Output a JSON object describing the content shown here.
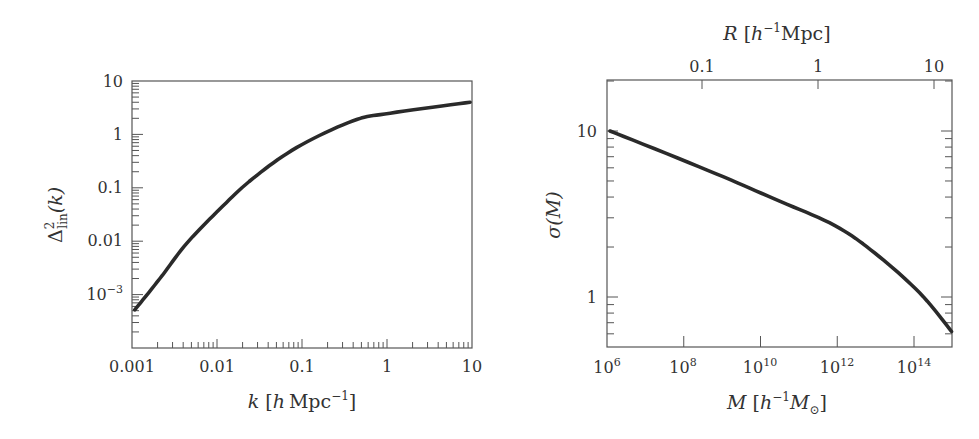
{
  "chart_data": [
    {
      "type": "line",
      "title": "",
      "xlabel": "k [h Mpc^-1]",
      "ylabel": "Δ²_lin(k)",
      "xscale": "log",
      "yscale": "log",
      "xlim": [
        0.001,
        10
      ],
      "ylim": [
        0.0001,
        10
      ],
      "grid": false,
      "x_tick_labels": [
        "0.001",
        "0.01",
        "0.1",
        "1",
        "10"
      ],
      "y_tick_labels": [
        "10",
        "1",
        "0.1",
        "0.01",
        "10^-3"
      ],
      "series": [
        {
          "name": "Δ²_lin(k)",
          "x": [
            0.00108,
            0.00213,
            0.0044,
            0.0108,
            0.0265,
            0.087,
            0.4,
            1.09,
            9.5
          ],
          "y": [
            0.00052,
            0.002,
            0.0091,
            0.04,
            0.15,
            0.57,
            1.8,
            2.5,
            4.0
          ]
        }
      ]
    },
    {
      "type": "line",
      "title": "",
      "xlabel": "M [h^-1 M_⊙]",
      "ylabel": "σ(M)",
      "x2label": "R [h^-1 Mpc]",
      "xscale": "log",
      "yscale": "log",
      "xlim": [
        1000000.0,
        1100000000000000.0
      ],
      "ylim": [
        0.5,
        20
      ],
      "grid": false,
      "x_tick_labels": [
        "10^6",
        "10^8",
        "10^10",
        "10^12",
        "10^14"
      ],
      "x2_tick_labels": [
        "0.1",
        "1",
        "10"
      ],
      "y_tick_labels": [
        "10",
        "1"
      ],
      "series": [
        {
          "name": "σ(M)",
          "x": [
            1200000.0,
            420000000.0,
            23000000000.0,
            850000000000.0,
            9500000000000.0,
            140000000000000.0,
            950000000000000.0
          ],
          "y": [
            10.0,
            5.8,
            3.9,
            2.7,
            1.84,
            1.06,
            0.62
          ]
        }
      ]
    }
  ],
  "left_chart": {
    "x_ticks": {
      "t0": "0.001",
      "t1": "0.01",
      "t2": "0.1",
      "t3": "1",
      "t4": "10"
    },
    "y_ticks": {
      "t0": "10",
      "t1": "1",
      "t2": "0.1",
      "t3": "0.01",
      "t4_base": "10",
      "t4_exp": "−3"
    },
    "xlabel": {
      "var": "k",
      "open": "[",
      "h": "h",
      "unit": "Mpc",
      "exp": "−1",
      "close": "]"
    },
    "ylabel": {
      "delta": "Δ",
      "sup": "2",
      "sub": "lin",
      "arg": "(k)"
    }
  },
  "right_chart": {
    "x_ticks": {
      "t0_base": "10",
      "t0_exp": "6",
      "t1_base": "10",
      "t1_exp": "8",
      "t2_base": "10",
      "t2_exp": "10",
      "t3_base": "10",
      "t3_exp": "12",
      "t4_base": "10",
      "t4_exp": "14"
    },
    "top_ticks": {
      "t0": "0.1",
      "t1": "1",
      "t2": "10"
    },
    "y_ticks": {
      "t0": "10",
      "t1": "1"
    },
    "xlabel": {
      "var": "M",
      "open": "[",
      "h": "h",
      "exp": "−1",
      "msun": "M",
      "sun_sub": "⊙",
      "close": "]"
    },
    "toplabel": {
      "var": "R",
      "open": "[",
      "h": "h",
      "exp": "−1",
      "unit": "Mpc",
      "close": "]"
    },
    "ylabel": {
      "sigma": "σ",
      "arg": "(M)"
    }
  }
}
